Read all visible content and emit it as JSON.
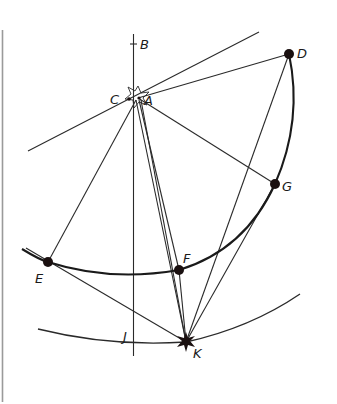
{
  "figure": {
    "type": "geometric-construction",
    "labels": {
      "B": "B",
      "C": "C",
      "A": "A",
      "D": "D",
      "G": "G",
      "F": "F",
      "E": "E",
      "J": "J",
      "K": "K"
    },
    "points": {
      "A": {
        "x": 138,
        "y": 98
      },
      "C": {
        "x": 130,
        "y": 99
      },
      "D": {
        "x": 289,
        "y": 54
      },
      "G": {
        "x": 275,
        "y": 184
      },
      "F": {
        "x": 179,
        "y": 270
      },
      "E": {
        "x": 48,
        "y": 262
      },
      "K": {
        "x": 186,
        "y": 342
      }
    },
    "colors": {
      "ink": "#1a1a1a",
      "background": "#ffffff",
      "border": "#9a9a9a"
    }
  }
}
